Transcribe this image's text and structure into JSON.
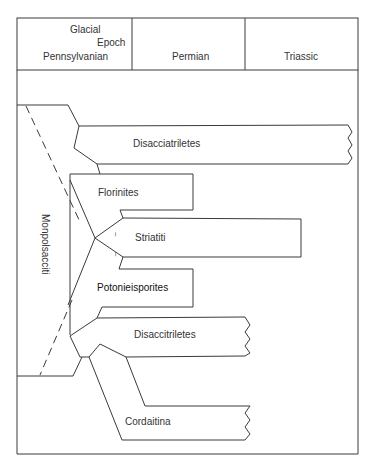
{
  "header": {
    "columns": [
      {
        "label_lines": [
          "Glacial",
          "Epoch",
          "Pennsylvanian"
        ]
      },
      {
        "label": "Permian"
      },
      {
        "label": "Triassic"
      }
    ],
    "glacial": "Glacial",
    "epoch": "Epoch",
    "pennsylvanian": "Pennsylvanian",
    "permian": "Permian",
    "triassic": "Triassic"
  },
  "taxa": {
    "monpolsacciti": "Monpolsacciti",
    "disacciatriletes": "Disacciatriletes",
    "florinites": "Florinites",
    "striatiti": "Striatiti",
    "potonieisporites": "Potonieisporites",
    "disaccitriletes": "Disaccitriletes",
    "cordaitina": "Cordaitina"
  },
  "uncertainty_marks": [
    "?",
    "?"
  ],
  "colors": {
    "line": "#3a3a3a",
    "background": "#ffffff"
  }
}
